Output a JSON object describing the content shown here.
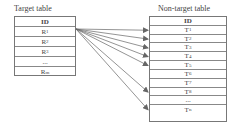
{
  "target_table": {
    "caption": "Target table",
    "rows": [
      {
        "main": "ID",
        "sub": "",
        "bold": true
      },
      {
        "main": "R",
        "sub": "1"
      },
      {
        "main": "R",
        "sub": "2"
      },
      {
        "main": "R",
        "sub": "3"
      },
      {
        "main": "...",
        "sub": ""
      },
      {
        "main": "R",
        "sub": "m"
      }
    ]
  },
  "non_target_table": {
    "caption": "Non-target table",
    "rows": [
      {
        "main": "ID",
        "sub": "",
        "bold": true
      },
      {
        "main": "T",
        "sub": "1"
      },
      {
        "main": "T",
        "sub": "2"
      },
      {
        "main": "T",
        "sub": "3"
      },
      {
        "main": "T",
        "sub": "4"
      },
      {
        "main": "T",
        "sub": "5"
      },
      {
        "main": "T",
        "sub": "6"
      },
      {
        "main": "T",
        "sub": "7"
      },
      {
        "main": "T",
        "sub": "8"
      },
      {
        "main": "...",
        "sub": ""
      },
      {
        "main": "T",
        "sub": "n"
      }
    ]
  },
  "mappings": {
    "source_row": 1,
    "target_rows": [
      1,
      2,
      3,
      4,
      5,
      8,
      10
    ]
  },
  "colors": {
    "line": "#666666",
    "border": "#777777"
  }
}
